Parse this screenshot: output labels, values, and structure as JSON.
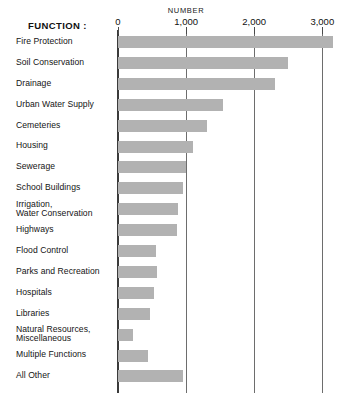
{
  "header": {
    "function_label": "FUNCTION :",
    "number_label": "NUMBER"
  },
  "axis": {
    "ticks": [
      {
        "label": "0",
        "value": 0
      },
      {
        "label": "1,000",
        "value": 1000
      },
      {
        "label": "2,000",
        "value": 2000
      },
      {
        "label": "3,000",
        "value": 3000
      }
    ]
  },
  "colors": {
    "bar": "#b2b2b2",
    "axis": "#3b3b3b",
    "grid": "#6d6d6d",
    "text": "#141414",
    "background": "#ffffff"
  },
  "chart_data": {
    "type": "bar",
    "orientation": "horizontal",
    "title": "NUMBER",
    "xlabel": "NUMBER",
    "ylabel": "FUNCTION :",
    "xlim": [
      0,
      3200
    ],
    "grid": true,
    "legend": "none",
    "tick_labels": [
      "0",
      "1,000",
      "2,000",
      "3,000"
    ],
    "tick_values": [
      0,
      1000,
      2000,
      3000
    ],
    "categories": [
      "Fire Protection",
      "Soil Conservation",
      "Drainage",
      "Urban Water Supply",
      "Cemeteries",
      "Housing",
      "Sewerage",
      "School Buildings",
      "Irrigation,\nWater Conservation",
      "Highways",
      "Flood Control",
      "Parks and Recreation",
      "Hospitals",
      "Libraries",
      "Natural Resources,\nMiscellaneous",
      "Multiple Functions",
      "All Other"
    ],
    "values": [
      3160,
      2495,
      2305,
      1540,
      1305,
      1100,
      1000,
      955,
      880,
      865,
      555,
      570,
      525,
      470,
      220,
      440,
      950
    ]
  },
  "rows": [
    {
      "label_line1": "Fire Protection",
      "label_line2": "",
      "value": 3160
    },
    {
      "label_line1": "Soil Conservation",
      "label_line2": "",
      "value": 2495
    },
    {
      "label_line1": "Drainage",
      "label_line2": "",
      "value": 2305
    },
    {
      "label_line1": "Urban Water Supply",
      "label_line2": "",
      "value": 1540
    },
    {
      "label_line1": "Cemeteries",
      "label_line2": "",
      "value": 1305
    },
    {
      "label_line1": "Housing",
      "label_line2": "",
      "value": 1100
    },
    {
      "label_line1": "Sewerage",
      "label_line2": "",
      "value": 1000
    },
    {
      "label_line1": "School Buildings",
      "label_line2": "",
      "value": 955
    },
    {
      "label_line1": "Irrigation,",
      "label_line2": "Water Conservation",
      "value": 880
    },
    {
      "label_line1": "Highways",
      "label_line2": "",
      "value": 865
    },
    {
      "label_line1": "Flood Control",
      "label_line2": "",
      "value": 555
    },
    {
      "label_line1": "Parks and Recreation",
      "label_line2": "",
      "value": 570
    },
    {
      "label_line1": "Hospitals",
      "label_line2": "",
      "value": 525
    },
    {
      "label_line1": "Libraries",
      "label_line2": "",
      "value": 470
    },
    {
      "label_line1": "Natural Resources,",
      "label_line2": "Miscellaneous",
      "value": 220
    },
    {
      "label_line1": "Multiple Functions",
      "label_line2": "",
      "value": 440
    },
    {
      "label_line1": "All Other",
      "label_line2": "",
      "value": 950
    }
  ]
}
